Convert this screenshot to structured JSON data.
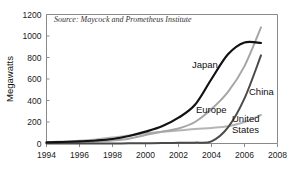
{
  "chart_data": {
    "type": "line",
    "title": "",
    "subtitle": "",
    "xlabel": "",
    "ylabel": "Megawatts",
    "xlim": [
      1994,
      2008
    ],
    "ylim": [
      0,
      1200
    ],
    "grid": false,
    "legend_position": "inline-annotations",
    "source_note": "Source: Maycock and Prometheus Institute",
    "x_ticks": [
      "1994",
      "1996",
      "1998",
      "2000",
      "2002",
      "2004",
      "2006",
      "2008"
    ],
    "y_ticks": [
      "0",
      "200",
      "400",
      "600",
      "800",
      "1000",
      "1200"
    ],
    "x": [
      1994,
      1995,
      1996,
      1997,
      1998,
      1999,
      2000,
      2001,
      2002,
      2003,
      2004,
      2005,
      2006,
      2007
    ],
    "series": [
      {
        "name": "Japan",
        "color": "#121212",
        "width": 2.2,
        "values": [
          10,
          14,
          20,
          28,
          42,
          70,
          110,
          160,
          240,
          360,
          600,
          830,
          940,
          935
        ]
      },
      {
        "name": "Europe",
        "color": "#a6a6a6",
        "width": 2.0,
        "values": [
          5,
          8,
          12,
          18,
          28,
          45,
          80,
          110,
          140,
          200,
          320,
          480,
          720,
          1080
        ]
      },
      {
        "name": "China",
        "color": "#4a4a4a",
        "width": 2.0,
        "values": [
          0,
          0,
          0,
          0,
          0,
          2,
          3,
          4,
          6,
          8,
          20,
          150,
          420,
          820
        ]
      },
      {
        "name": "United States",
        "color": "#b5b5b5",
        "width": 2.0,
        "values": [
          12,
          18,
          26,
          38,
          55,
          75,
          95,
          110,
          120,
          135,
          145,
          160,
          200,
          265
        ]
      }
    ],
    "annotations": [
      {
        "label": "Japan",
        "x": 192,
        "y": 68
      },
      {
        "label": "Europe",
        "x": 196,
        "y": 113
      },
      {
        "label": "China",
        "x": 249,
        "y": 95
      },
      {
        "label": "United",
        "x": 232,
        "y": 122
      },
      {
        "label": "States",
        "x": 232,
        "y": 133
      }
    ]
  }
}
